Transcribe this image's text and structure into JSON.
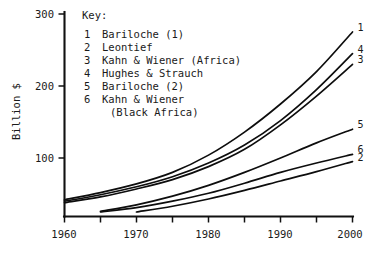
{
  "chart_data": {
    "type": "line",
    "title": "",
    "xlabel": "",
    "ylabel": "Billion $",
    "xlim": [
      1960,
      2000
    ],
    "ylim": [
      19,
      300
    ],
    "grid": false,
    "legend_position": "inside-top-left",
    "legend_title": "Key:",
    "x_ticks": [
      1960,
      1965,
      1970,
      1975,
      1980,
      1985,
      1990,
      1995,
      2000
    ],
    "x_tick_labels": [
      "1960",
      "",
      "1970",
      "",
      "1980",
      "",
      "1990",
      "",
      "2000"
    ],
    "y_ticks": [
      100,
      200,
      300
    ],
    "y_tick_labels": [
      "100",
      "200",
      "300"
    ],
    "series": [
      {
        "key": "1",
        "name": "Bariloche (1)",
        "end_label": "1",
        "x": [
          1960,
          1965,
          1970,
          1975,
          1980,
          1985,
          1990,
          1995,
          2000
        ],
        "values": [
          42,
          52,
          64,
          80,
          104,
          136,
          175,
          220,
          275
        ]
      },
      {
        "key": "2",
        "name": "Leontief",
        "end_label": "2",
        "x": [
          1970,
          1975,
          1980,
          1985,
          1990,
          1995,
          2000
        ],
        "values": [
          25,
          33,
          43,
          55,
          68,
          81,
          95
        ]
      },
      {
        "key": "3",
        "name": "Kahn & Wiener (Africa)",
        "end_label": "3",
        "x": [
          1960,
          1965,
          1970,
          1975,
          1980,
          1985,
          1990,
          1995,
          2000
        ],
        "values": [
          38,
          46,
          57,
          70,
          88,
          112,
          146,
          186,
          230
        ]
      },
      {
        "key": "4",
        "name": "Hughes & Strauch",
        "end_label": "4",
        "x": [
          1960,
          1965,
          1970,
          1975,
          1980,
          1985,
          1990,
          1995,
          2000
        ],
        "values": [
          40,
          49,
          60,
          74,
          93,
          118,
          152,
          195,
          245
        ]
      },
      {
        "key": "5",
        "name": "Bariloche (2)",
        "end_label": "5",
        "x": [
          1965,
          1970,
          1975,
          1980,
          1985,
          1990,
          1995,
          2000
        ],
        "values": [
          26,
          35,
          47,
          62,
          80,
          100,
          121,
          140
        ]
      },
      {
        "key": "6",
        "name": "Kahn & Wiener (Black Africa)",
        "end_label": "6",
        "x": [
          1965,
          1970,
          1975,
          1980,
          1985,
          1990,
          1995,
          2000
        ],
        "values": [
          25,
          31,
          40,
          51,
          65,
          80,
          93,
          105
        ]
      }
    ]
  },
  "axes": {
    "y_title": "Billion $",
    "y_labels": [
      "300",
      "200",
      "100"
    ],
    "x_labels": [
      "1960",
      "1970",
      "1980",
      "1990",
      "2000"
    ]
  },
  "key": {
    "title": "Key:",
    "entries": [
      {
        "num": "1",
        "label": "Bariloche (1)",
        "label2": ""
      },
      {
        "num": "2",
        "label": "Leontief",
        "label2": ""
      },
      {
        "num": "3",
        "label": "Kahn & Wiener (Africa)",
        "label2": ""
      },
      {
        "num": "4",
        "label": "Hughes & Strauch",
        "label2": ""
      },
      {
        "num": "5",
        "label": "Bariloche (2)",
        "label2": ""
      },
      {
        "num": "6",
        "label": "Kahn & Wiener",
        "label2": "(Black Africa)"
      }
    ]
  },
  "end_labels": [
    "1",
    "4",
    "3",
    "5",
    "6",
    "2"
  ],
  "colors": {
    "ink": "#111111",
    "background": "#ffffff"
  }
}
